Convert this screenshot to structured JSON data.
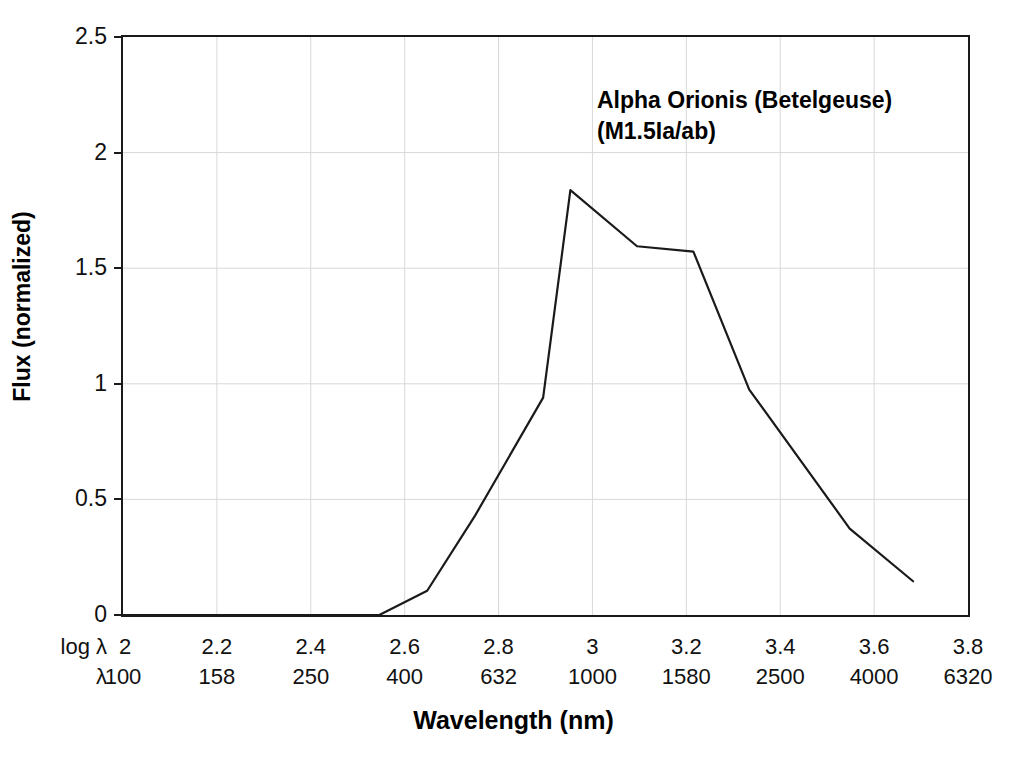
{
  "figure": {
    "annotation_line1": "Alpha Orionis (Betelgeuse)",
    "annotation_line2": "(M1.5Ia/ab)",
    "xlabel": "Wavelength (nm)",
    "ylabel": "Flux (normalized)",
    "row_head_log": "log λ",
    "row_head_lambda": "λ",
    "line_color": "#1a1a1a",
    "grid_color": "#d8d8d8",
    "axis_color": "#1a1a1a",
    "background": "#ffffff"
  },
  "chart_data": {
    "type": "line",
    "title": "Alpha Orionis (Betelgeuse) (M1.5Ia/ab)",
    "xlabel": "Wavelength (nm)",
    "ylabel": "Flux (normalized)",
    "xlim": [
      2.0,
      3.8
    ],
    "ylim": [
      0,
      2.5
    ],
    "grid": true,
    "legend": "none",
    "x_axis_rows": [
      {
        "name": "log λ",
        "ticks": [
          "2",
          "2.2",
          "2.4",
          "2.6",
          "2.8",
          "3",
          "3.2",
          "3.4",
          "3.6",
          "3.8"
        ]
      },
      {
        "name": "λ",
        "ticks": [
          "100",
          "158",
          "250",
          "400",
          "632",
          "1000",
          "1580",
          "2500",
          "4000",
          "6320"
        ]
      }
    ],
    "y_ticks": [
      "0",
      "0.5",
      "1",
      "1.5",
      "2",
      "2.5"
    ],
    "y_tick_values": [
      0,
      0.5,
      1,
      1.5,
      2,
      2.5
    ],
    "series": [
      {
        "name": "Alpha Orionis (Betelgeuse) spectrum",
        "x": [
          2.0,
          2.546,
          2.648,
          2.75,
          2.895,
          2.953,
          3.095,
          3.215,
          3.334,
          3.548,
          3.683
        ],
        "y": [
          0.0,
          0.0,
          0.105,
          0.43,
          0.94,
          1.838,
          1.595,
          1.572,
          0.975,
          0.374,
          0.146
        ],
        "wavelength_nm": [
          100,
          352,
          445,
          562,
          785,
          898,
          1245,
          1641,
          2158,
          3532,
          4819
        ]
      }
    ]
  }
}
